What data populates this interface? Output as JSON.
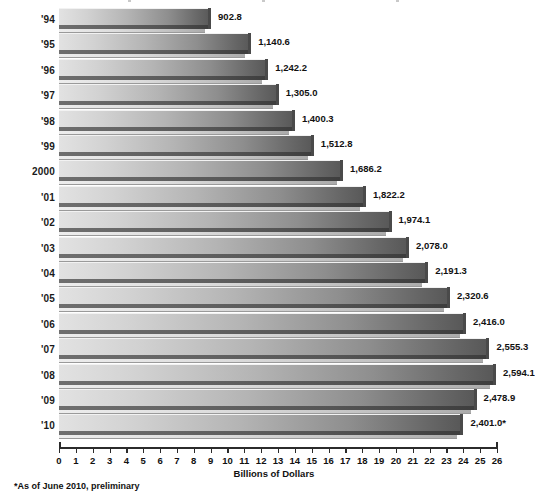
{
  "chart_data": {
    "type": "bar",
    "orientation": "horizontal",
    "title": "",
    "xlabel": "Billions of Dollars",
    "ylabel": "",
    "xlim": [
      0,
      26
    ],
    "xticks": [
      0,
      1,
      2,
      3,
      4,
      5,
      6,
      7,
      8,
      9,
      10,
      11,
      12,
      13,
      14,
      15,
      16,
      17,
      18,
      19,
      20,
      21,
      22,
      23,
      24,
      25,
      26
    ],
    "grid": false,
    "legend": null,
    "value_scale_note": "axis units are hundreds of billions; value labels are the plotted amounts",
    "categories": [
      "'94",
      "'95",
      "'96",
      "'97",
      "'98",
      "'99",
      "2000",
      "'01",
      "'02",
      "'03",
      "'04",
      "'05",
      "'06",
      "'07",
      "'08",
      "'09",
      "'10"
    ],
    "values": [
      902.8,
      1140.6,
      1242.2,
      1305.0,
      1400.3,
      1512.8,
      1686.2,
      1822.2,
      1974.1,
      2078.0,
      2191.3,
      2320.6,
      2416.0,
      2555.3,
      2594.1,
      2478.9,
      2401.0
    ],
    "value_labels": [
      "902.8",
      "1,140.6",
      "1,242.2",
      "1,305.0",
      "1,400.3",
      "1,512.8",
      "1,686.2",
      "1,822.2",
      "1,974.1",
      "2,078.0",
      "2,191.3",
      "2,320.6",
      "2,416.0",
      "2,555.3",
      "2,594.1",
      "2,478.9",
      "2,401.0*"
    ],
    "annotations": [
      "*As of June 2010, preliminary"
    ],
    "colors": {
      "bar_light": "#e2e2e2",
      "bar_dark": "#575757",
      "bevel": "#4a4a4a",
      "axis": "#2b2b2b",
      "text": "#111111",
      "background": "#ffffff"
    }
  },
  "footnote": "*As of June 2010, preliminary",
  "axis_title": "Billions of Dollars"
}
